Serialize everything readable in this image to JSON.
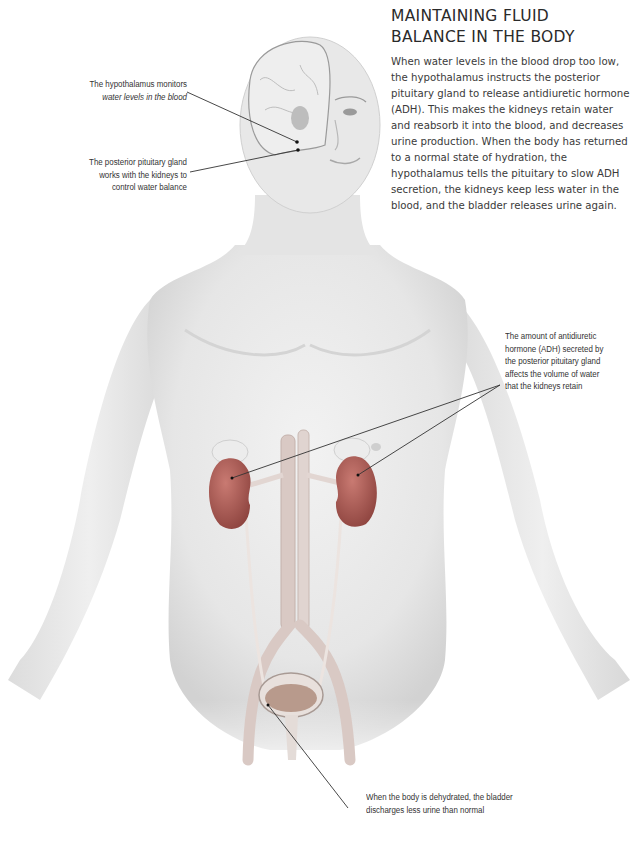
{
  "header": {
    "title_line1": "MAINTAINING FLUID",
    "title_line2": "BALANCE IN THE BODY"
  },
  "intro": {
    "text": "When water levels in the blood drop too low, the hypothalamus instructs the posterior pituitary gland to release antidiuretic hormone (ADH). This makes the kidneys retain water and reabsorb it into the blood, and decreases urine production. When the body has returned to a normal state of hydration, the hypothalamus tells the pituitary to slow ADH secretion, the kidneys keep less water in the blood, and the bladder releases urine again."
  },
  "callouts": {
    "hypothalamus": {
      "line1": "The hypothalamus monitors",
      "line2_italic": "water levels in the blood"
    },
    "pituitary": {
      "line1": "The posterior pituitary gland",
      "line2": "works with the kidneys to",
      "line3": "control water balance"
    },
    "adh": {
      "line1": "The amount of antidiuretic",
      "line2": "hormone (ADH) secreted by",
      "line3": "the posterior pituitary gland",
      "line4": "affects the volume of water",
      "line5": "that the kidneys retain"
    },
    "bladder": {
      "line1": "When the body is dehydrated, the bladder",
      "line2": "discharges less urine than normal"
    }
  },
  "colors": {
    "background": "#ffffff",
    "skin": "#ebebeb",
    "skin_shadow": "#cfcfcf",
    "kidney": "#b8655e",
    "kidney_dark": "#8f4540",
    "vessel": "#d9c9c4",
    "leader_line": "#333333",
    "text": "#333333"
  }
}
